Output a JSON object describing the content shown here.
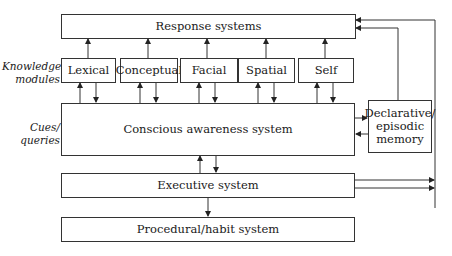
{
  "diagram": {
    "side_labels": {
      "knowledge": "Knowledge modules",
      "cues": "Cues/ queries"
    },
    "boxes": {
      "response": "Response systems",
      "modules": [
        "Lexical",
        "Conceptual",
        "Facial",
        "Spatial",
        "Self"
      ],
      "conscious": "Conscious awareness system",
      "declarative": "Declarative/ episodic memory",
      "executive": "Executive system",
      "procedural": "Procedural/habit system"
    },
    "edges": [
      {
        "from": "Lexical",
        "to": "Response systems"
      },
      {
        "from": "Conceptual",
        "to": "Response systems"
      },
      {
        "from": "Facial",
        "to": "Response systems"
      },
      {
        "from": "Spatial",
        "to": "Response systems"
      },
      {
        "from": "Self",
        "to": "Response systems"
      },
      {
        "from": "Conscious awareness system",
        "to": "Lexical",
        "bidirectional": true
      },
      {
        "from": "Conscious awareness system",
        "to": "Conceptual",
        "bidirectional": true
      },
      {
        "from": "Conscious awareness system",
        "to": "Facial",
        "bidirectional": true
      },
      {
        "from": "Conscious awareness system",
        "to": "Spatial",
        "bidirectional": true
      },
      {
        "from": "Conscious awareness system",
        "to": "Self",
        "bidirectional": true
      },
      {
        "from": "Conscious awareness system",
        "to": "Declarative/ episodic memory",
        "bidirectional": true
      },
      {
        "from": "Declarative/ episodic memory",
        "to": "Response systems"
      },
      {
        "from": "Conscious awareness system",
        "to": "Executive system",
        "bidirectional": true
      },
      {
        "from": "Executive system",
        "to": "Procedural/habit system"
      },
      {
        "from": "Executive system",
        "to": "Response systems"
      }
    ]
  }
}
